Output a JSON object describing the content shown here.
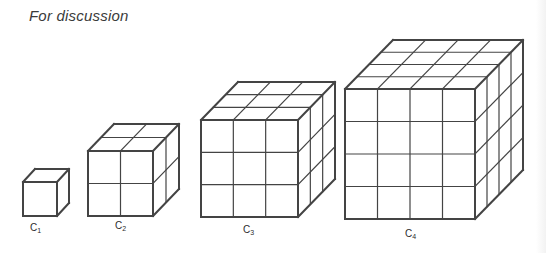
{
  "heading": "For discussion",
  "stroke_color": "#444444",
  "cubes": [
    {
      "id": "C1",
      "label_main": "C",
      "label_sub": "1",
      "n": 1,
      "front": {
        "x": 23,
        "y": 182,
        "size": 34
      },
      "depth": {
        "dx": 12,
        "dy": -13
      },
      "label_pos": {
        "x": 30,
        "y": 222
      }
    },
    {
      "id": "C2",
      "label_main": "C",
      "label_sub": "2",
      "n": 2,
      "front": {
        "x": 88,
        "y": 151,
        "size": 65
      },
      "depth": {
        "dx": 26,
        "dy": -27
      },
      "label_pos": {
        "x": 115,
        "y": 220
      }
    },
    {
      "id": "C3",
      "label_main": "C",
      "label_sub": "3",
      "n": 3,
      "front": {
        "x": 201,
        "y": 120,
        "size": 97
      },
      "depth": {
        "dx": 37,
        "dy": -38
      },
      "label_pos": {
        "x": 243,
        "y": 224
      }
    },
    {
      "id": "C4",
      "label_main": "C",
      "label_sub": "4",
      "n": 4,
      "front": {
        "x": 345,
        "y": 89,
        "size": 130
      },
      "depth": {
        "dx": 48,
        "dy": -49
      },
      "label_pos": {
        "x": 405,
        "y": 228
      }
    }
  ]
}
